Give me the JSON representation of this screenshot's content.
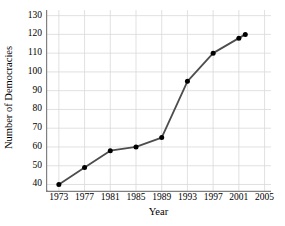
{
  "chart_data": {
    "type": "line",
    "title": "",
    "xlabel": "Year",
    "ylabel": "Number of Democracies",
    "x": [
      1973,
      1977,
      1981,
      1985,
      1989,
      1993,
      1997,
      2001,
      2002
    ],
    "values": [
      40,
      49,
      58,
      60,
      65,
      95,
      110,
      118,
      120
    ],
    "series": [
      {
        "name": "Number of Democracies",
        "x": [
          1973,
          1977,
          1981,
          1985,
          1989,
          1993,
          1997,
          2001,
          2002
        ],
        "values": [
          40,
          49,
          58,
          60,
          65,
          95,
          110,
          118,
          120
        ]
      }
    ],
    "xtick_labels": [
      "1973",
      "1977",
      "1981",
      "1985",
      "1989",
      "1993",
      "1997",
      "2001",
      "2005"
    ],
    "xticks": [
      1973,
      1977,
      1981,
      1985,
      1989,
      1993,
      1997,
      2001,
      2005
    ],
    "ytick_labels": [
      "40",
      "50",
      "60",
      "70",
      "80",
      "90",
      "100",
      "110",
      "120",
      "130"
    ],
    "yticks": [
      40,
      50,
      60,
      70,
      80,
      90,
      100,
      110,
      120,
      130
    ],
    "xlim": [
      1971,
      2006
    ],
    "ylim": [
      36,
      133
    ],
    "grid": true,
    "legend": "none",
    "y_axis_break": true,
    "colors": {
      "line": "#4d4d4d",
      "marker": "#000000",
      "grid": "#d9d9d9",
      "axis": "#808080",
      "background": "#ffffff",
      "text": "#000000"
    }
  }
}
